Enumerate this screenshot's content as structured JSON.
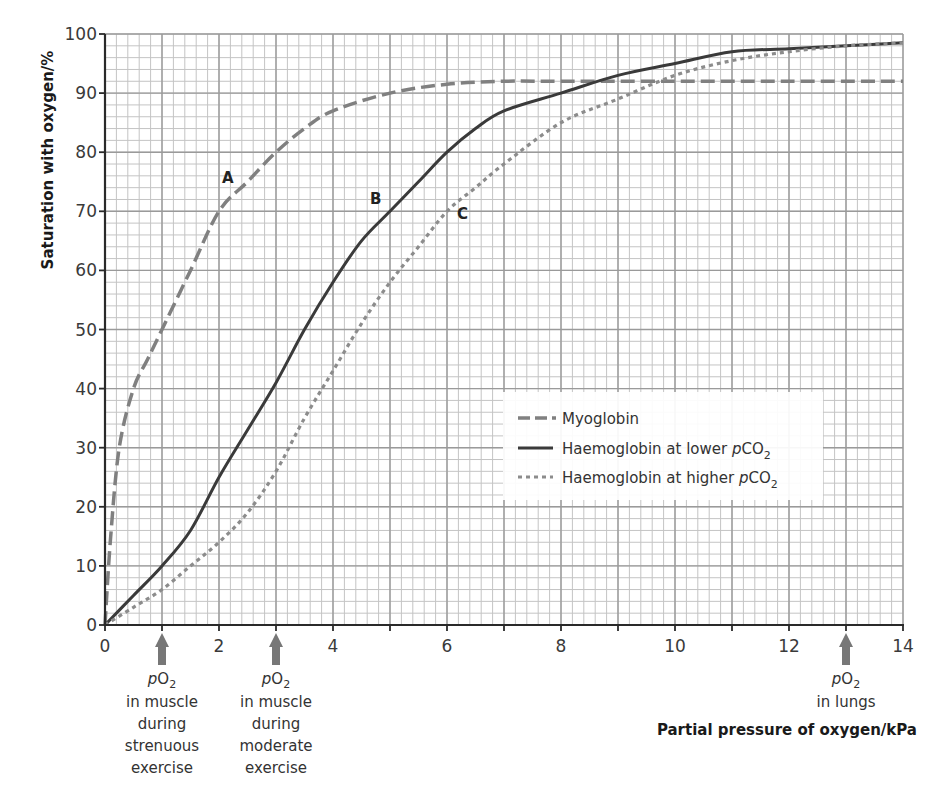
{
  "chart_data": {
    "type": "line",
    "title": "",
    "xlabel": "Partial pressure of oxygen/kPa",
    "ylabel": "Saturation with oxygen/%",
    "xlim": [
      0,
      14
    ],
    "ylim": [
      0,
      100
    ],
    "x_ticks": [
      "0",
      "2",
      "4",
      "6",
      "8",
      "10",
      "12",
      "14"
    ],
    "y_ticks": [
      "0",
      "10",
      "20",
      "30",
      "40",
      "50",
      "60",
      "70",
      "80",
      "90",
      "100"
    ],
    "grid": true,
    "grid_minor": {
      "x_step": 0.2,
      "y_step": 2
    },
    "legend_position": "lower right (inside plot)",
    "series": [
      {
        "name": "Myoglobin",
        "label": "A",
        "style": "dashed",
        "color": "#808080",
        "x": [
          0,
          0.1,
          0.25,
          0.5,
          0.75,
          1,
          1.5,
          2,
          2.5,
          3,
          3.5,
          4,
          5,
          6,
          7,
          8,
          10,
          12,
          14
        ],
        "y": [
          0,
          15,
          30,
          40,
          45,
          50,
          60,
          70,
          75,
          80,
          84,
          87,
          90,
          91.5,
          92,
          92,
          92,
          92,
          92
        ]
      },
      {
        "name": "Haemoglobin at lower pCO2",
        "label": "B",
        "style": "solid",
        "color": "#3a3a3a",
        "x": [
          0,
          0.5,
          1,
          1.5,
          2,
          2.5,
          3,
          3.5,
          4,
          4.5,
          5,
          5.5,
          6,
          6.5,
          7,
          8,
          9,
          10,
          11,
          12,
          13,
          14
        ],
        "y": [
          0,
          5,
          10,
          16,
          25,
          33,
          41,
          50,
          58,
          65,
          70,
          75,
          80,
          84,
          87,
          90,
          93,
          95,
          97,
          97.5,
          98,
          98.5
        ]
      },
      {
        "name": "Haemoglobin at higher pCO2",
        "label": "C",
        "style": "dotted",
        "color": "#8c8c8c",
        "x": [
          0,
          0.5,
          1,
          1.5,
          2,
          2.5,
          3,
          3.5,
          4,
          4.5,
          5,
          5.5,
          6,
          6.5,
          7,
          8,
          9,
          10,
          11,
          12,
          13,
          14
        ],
        "y": [
          0,
          3,
          6,
          10,
          14,
          19,
          26,
          35,
          43,
          51,
          58,
          64,
          70,
          74,
          78,
          85,
          89,
          93,
          95.5,
          97,
          98,
          98.5
        ]
      }
    ],
    "annotations": [
      {
        "x": 1,
        "lines": [
          "pO2",
          "in muscle",
          "during",
          "strenuous",
          "exercise"
        ]
      },
      {
        "x": 3,
        "lines": [
          "pO2",
          "in muscle",
          "during",
          "moderate",
          "exercise"
        ]
      },
      {
        "x": 13,
        "lines": [
          "pO2",
          "in lungs"
        ]
      }
    ]
  },
  "labels": {
    "y_axis_title": "Saturation with oxygen/%",
    "x_axis_title": "Partial pressure of oxygen/kPa",
    "curve_a": "A",
    "curve_b": "B",
    "curve_c": "C"
  },
  "legend": {
    "items": [
      {
        "prefix": "Myoglobin",
        "italic": "",
        "sub": ""
      },
      {
        "prefix": "Haemoglobin at lower ",
        "italic": "p",
        "rest": "CO",
        "sub": "2"
      },
      {
        "prefix": "Haemoglobin at higher ",
        "italic": "p",
        "rest": "CO",
        "sub": "2"
      }
    ]
  },
  "annotations": {
    "strenuous": {
      "p": "p",
      "o": "O",
      "sub": "2",
      "l1": "in muscle",
      "l2": "during",
      "l3": "strenuous",
      "l4": "exercise"
    },
    "moderate": {
      "p": "p",
      "o": "O",
      "sub": "2",
      "l1": "in muscle",
      "l2": "during",
      "l3": "moderate",
      "l4": "exercise"
    },
    "lungs": {
      "p": "p",
      "o": "O",
      "sub": "2",
      "l1": "in lungs"
    }
  },
  "colors": {
    "grid_minor": "#c4c4c4",
    "grid_major": "#9a9a9a",
    "axis": "#2a2a2a",
    "arrow": "#777777",
    "legend_bg": "#ffffff"
  }
}
